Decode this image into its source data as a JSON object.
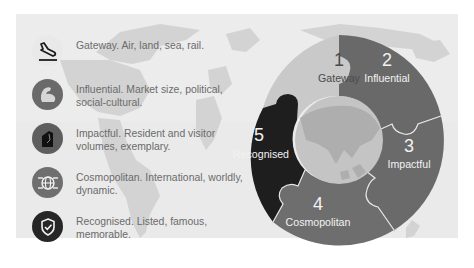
{
  "features": [
    {
      "id": 1,
      "icon": "airplane-landing-icon",
      "icon_bg": "#e9e9e9",
      "icon_fg": "#1c1c1c",
      "text": "Gateway. Air, land, sea, rail."
    },
    {
      "id": 2,
      "icon": "flexed-bicep-icon",
      "icon_bg": "#6a6a6a",
      "icon_fg": "#d6d6d6",
      "text": "Influential. Market size, political, social-cultural."
    },
    {
      "id": 3,
      "icon": "footprint-book-icon",
      "icon_bg": "#5e5e5e",
      "icon_fg": "#111111",
      "text": "Impactful. Resident and visitor volumes, exemplary."
    },
    {
      "id": 4,
      "icon": "globe-network-icon",
      "icon_bg": "#6f6f6f",
      "icon_fg": "#f2f2f2",
      "text": "Cosmopolitan. International, worldly, dynamic."
    },
    {
      "id": 5,
      "icon": "shield-check-icon",
      "icon_bg": "#262626",
      "icon_fg": "#f2f2f2",
      "text": "Recognised. Listed, famous, memorable."
    }
  ],
  "wheel": {
    "segments": [
      {
        "number": "1",
        "label": "Gateway",
        "color": "#c9c9c9",
        "text_color": "#4a4a4a"
      },
      {
        "number": "2",
        "label": "Influential",
        "color": "#696969",
        "text_color": "#f2f2f2"
      },
      {
        "number": "3",
        "label": "Impactful",
        "color": "#6a6a6a",
        "text_color": "#f2f2f2"
      },
      {
        "number": "4",
        "label": "Cosmopolitan",
        "color": "#6e6e6e",
        "text_color": "#f2f2f2"
      },
      {
        "number": "5",
        "label": "Recognised",
        "color": "#1e1e1e",
        "text_color": "#f2f2f2"
      }
    ],
    "center_color": "#c4c4c4"
  },
  "colors": {
    "background": "#ffffff",
    "map_panel": "#ececec",
    "continents": "#d2d2d2",
    "text": "#6b6b6b"
  }
}
